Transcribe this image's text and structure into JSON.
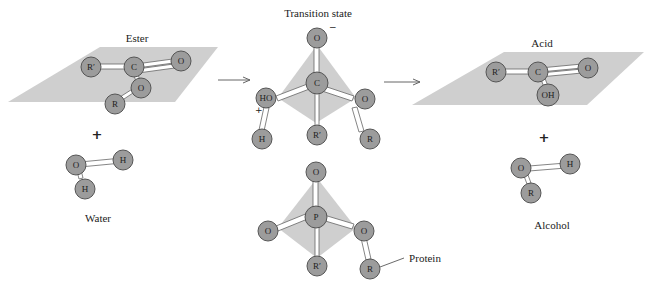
{
  "figure": {
    "colors": {
      "plane": "#cfcfcf",
      "atom_fill": "#9c9c9c",
      "atom_stroke": "#555555",
      "bond_fill": "#ffffff",
      "bond_stroke": "#666666",
      "text": "#222222"
    },
    "ester": {
      "label": "Ester",
      "atoms": [
        "R′",
        "C",
        "O",
        "O",
        "R"
      ]
    },
    "water": {
      "label": "Water",
      "atoms": [
        "O",
        "H",
        "H"
      ]
    },
    "plus_signs": [
      "+",
      "+"
    ],
    "arrows": [
      "→",
      "→"
    ],
    "transition_state": {
      "label": "Transition state",
      "atoms": [
        "O",
        "C",
        "HO",
        "O",
        "H",
        "R′",
        "R"
      ],
      "charge_minus": "−",
      "charge_plus": "+"
    },
    "phosphonate": {
      "atoms": [
        "O",
        "P",
        "O",
        "O",
        "R′",
        "R"
      ],
      "callout": "Protein"
    },
    "acid": {
      "label": "Acid",
      "atoms": [
        "R′",
        "C",
        "O",
        "OH"
      ]
    },
    "alcohol": {
      "label": "Alcohol",
      "atoms": [
        "O",
        "H",
        "R"
      ]
    }
  }
}
